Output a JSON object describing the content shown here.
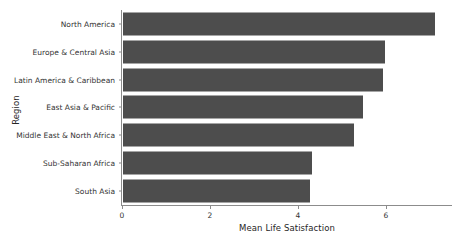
{
  "chart_data": {
    "type": "bar",
    "orientation": "horizontal",
    "title": "",
    "xlabel": "Mean Life Satisfaction",
    "ylabel": "Region",
    "categories": [
      "North America",
      "Europe & Central Asia",
      "Latin America & Caribbean",
      "East Asia & Pacific",
      "Middle East & North Africa",
      "Sub-Saharan Africa",
      "South Asia"
    ],
    "values": [
      7.1,
      5.95,
      5.9,
      5.45,
      5.25,
      4.3,
      4.25
    ],
    "xticks": [
      0,
      2,
      4,
      6
    ],
    "xlim": [
      0,
      7.5
    ],
    "grid": false,
    "legend": false,
    "bar_color": "#4d4d4d",
    "axis_color": "#8c8c8c",
    "background": "#ffffff"
  }
}
